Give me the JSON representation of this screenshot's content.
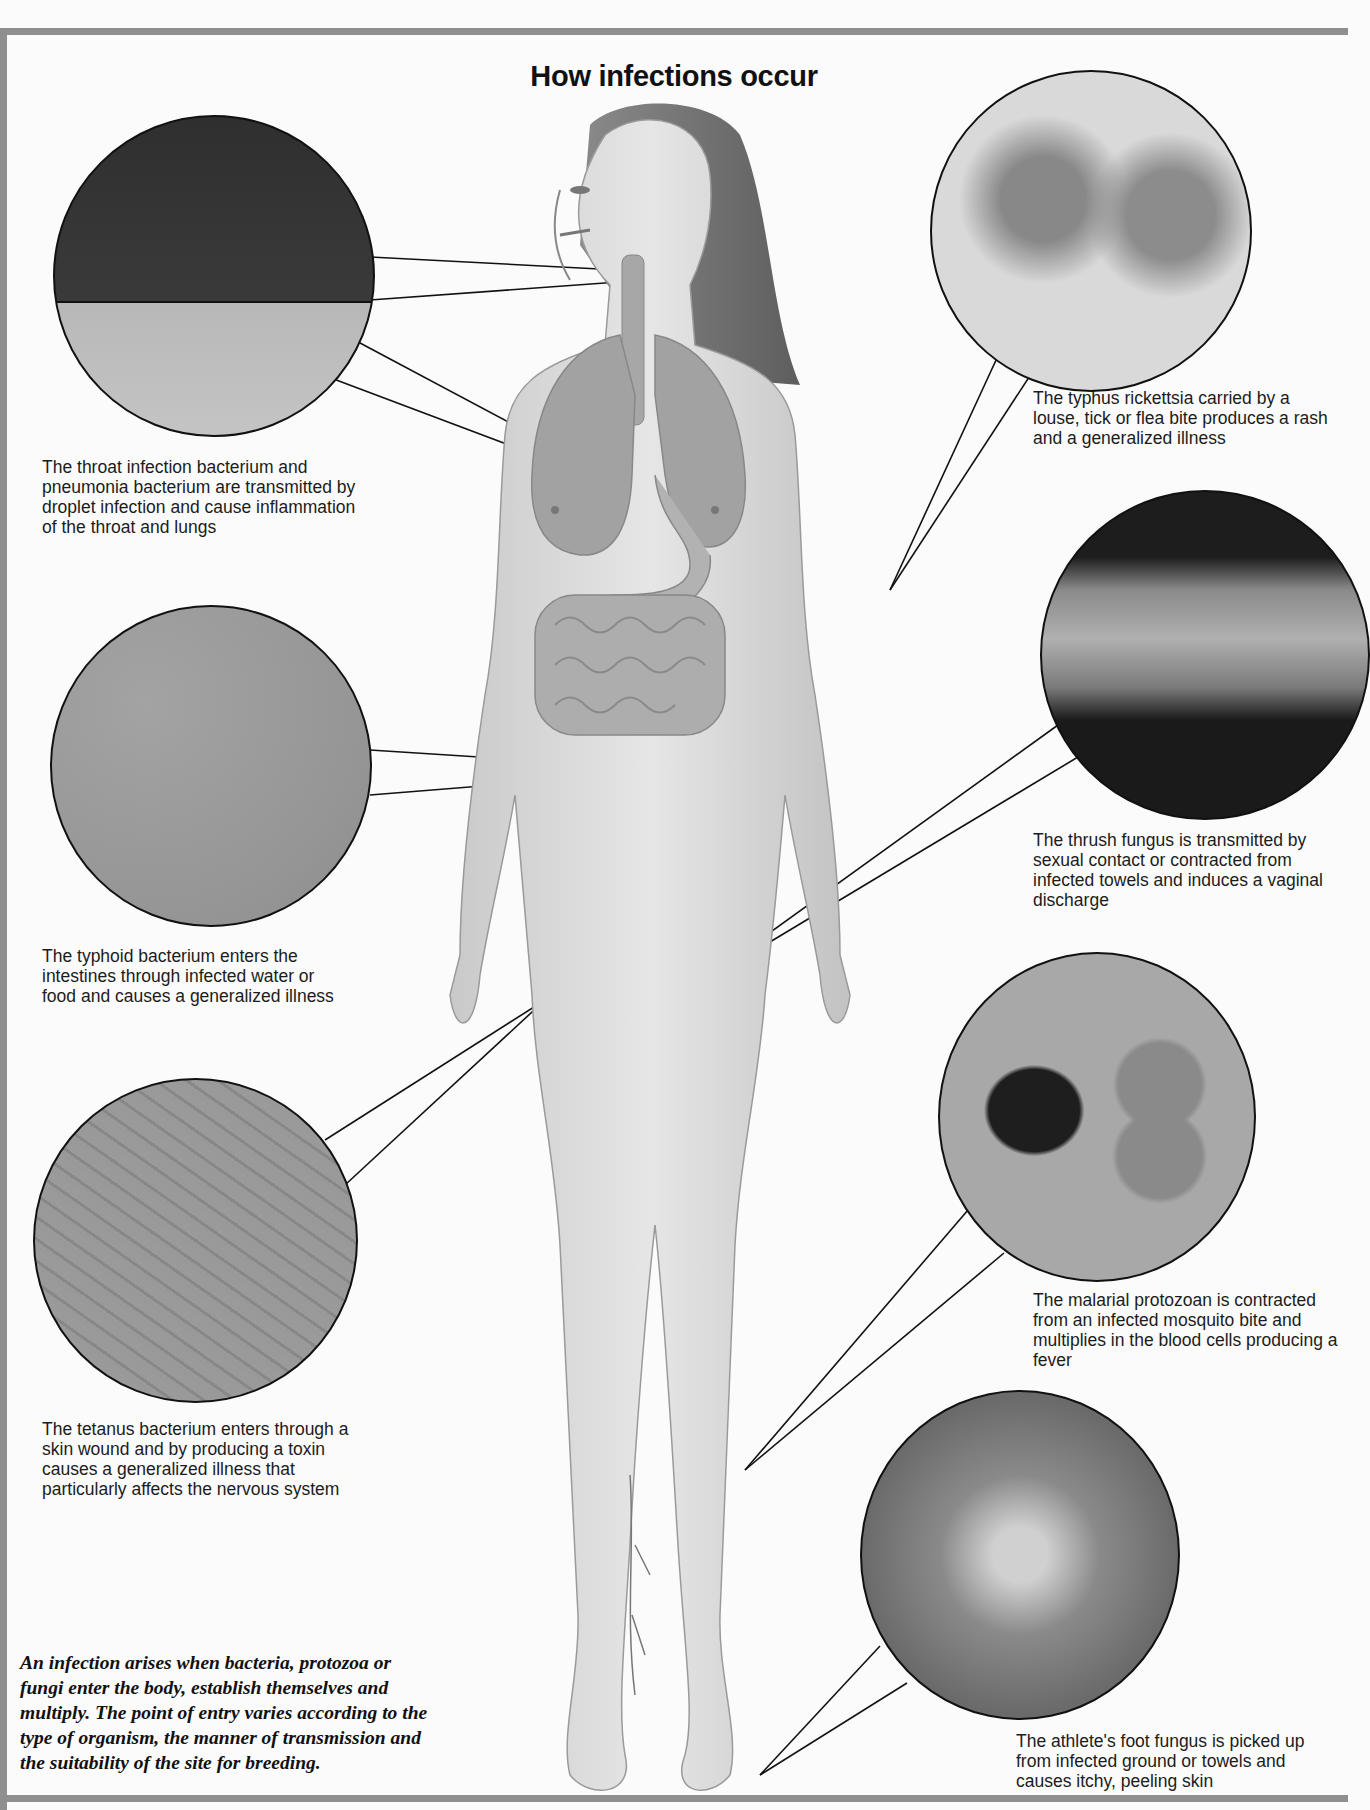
{
  "title": "How infections occur",
  "intro": "An infection arises when bacteria, protozoa or fungi enter the body, establish themselves and multiply. The point of entry varies according to the type of organism, the manner of transmission and the suitability of the site for breeding.",
  "callouts": [
    {
      "id": "throat-pneumonia",
      "organism": "throat infection bacterium and pneumonia bacterium",
      "site": "throat and lungs",
      "caption": "The throat infection bacterium and pneumonia bacterium are transmitted by droplet infection and cause inflammation of the throat and lungs"
    },
    {
      "id": "typhoid",
      "organism": "typhoid bacterium",
      "site": "intestines",
      "caption": "The typhoid bacterium enters the intestines through infected water or food and causes a generalized illness"
    },
    {
      "id": "tetanus",
      "organism": "tetanus bacterium",
      "site": "skin wound (hand)",
      "caption": "The tetanus bacterium enters through a skin wound and by producing a toxin causes a generalized illness that particularly affects the nervous system"
    },
    {
      "id": "typhus",
      "organism": "typhus rickettsia",
      "site": "skin (arm)",
      "caption": "The typhus rickettsia carried by a louse, tick or flea bite produces a rash and a generalized illness"
    },
    {
      "id": "thrush",
      "organism": "thrush fungus",
      "site": "genital area",
      "caption": "The thrush fungus is transmitted by sexual contact or contracted from infected towels and induces a vaginal discharge"
    },
    {
      "id": "malaria",
      "organism": "malarial protozoan",
      "site": "blood (leg)",
      "caption": "The malarial protozoan is contracted from an infected mosquito bite and multiplies in the blood cells producing a fever"
    },
    {
      "id": "athletes-foot",
      "organism": "athlete's foot fungus",
      "site": "foot",
      "caption": "The athlete's foot fungus is picked up from infected ground or towels and causes itchy, peeling skin"
    }
  ],
  "colors": {
    "border": "#8f8f8f",
    "background": "#fbfbfb",
    "ink": "#111111"
  }
}
